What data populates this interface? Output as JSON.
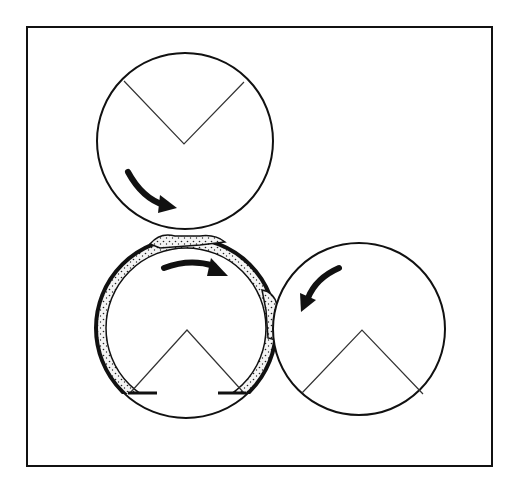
{
  "diagram": {
    "type": "roll coating / three-roll nip schematic",
    "top_clipped_caption": "",
    "colors": {
      "background": "#ffffff",
      "stroke": "#111111",
      "coating_fill": "#f4f4f4",
      "coating_dots": "#222222"
    },
    "frame": {
      "x": 27,
      "y": 27,
      "width": 465,
      "height": 439
    },
    "rollers": [
      {
        "id": "top-roller",
        "cx": 185,
        "cy": 141,
        "r": 88,
        "v_mark": "downward",
        "v": {
          "left": [
            124,
            81
          ],
          "apex": [
            184,
            144
          ],
          "right": [
            244,
            82
          ]
        }
      },
      {
        "id": "coated-roller",
        "cx": 186,
        "cy": 328,
        "r": 90,
        "inner_r": 80,
        "v_mark": "upward",
        "v": {
          "left": [
            130,
            393
          ],
          "apex": [
            187,
            330
          ],
          "right": [
            244,
            393
          ]
        },
        "coating": "stippled band around upper circumference",
        "dashes": [
          [
            130,
            157,
            393
          ],
          [
            218,
            244,
            393
          ]
        ]
      },
      {
        "id": "right-roller",
        "cx": 359,
        "cy": 329,
        "r": 86,
        "v_mark": "upward",
        "v": {
          "left": [
            302,
            393
          ],
          "apex": [
            362,
            330
          ],
          "right": [
            423,
            394
          ]
        }
      }
    ],
    "arrows": [
      {
        "id": "top-roller-rotation-arrow",
        "direction": "clockwise",
        "from": [
          127,
          172
        ],
        "to": [
          173,
          208
        ]
      },
      {
        "id": "coated-roller-rotation-arrow",
        "direction": "clockwise",
        "from": [
          163,
          267
        ],
        "to": [
          226,
          275
        ]
      },
      {
        "id": "right-roller-rotation-arrow",
        "direction": "counterclockwise",
        "from": [
          339,
          268
        ],
        "to": [
          301,
          311
        ]
      }
    ]
  }
}
